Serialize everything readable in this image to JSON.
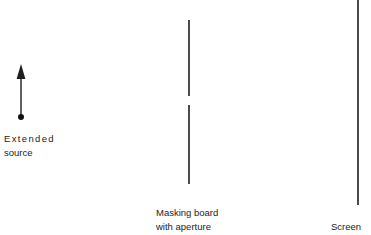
{
  "figure": {
    "background_color": "#ffffff",
    "stroke_color": "#2b2b2b",
    "text_color": "#1d1d1d",
    "width": 371,
    "height": 235
  },
  "labels": {
    "source": {
      "line1": "Extended",
      "line2": "source"
    },
    "mask": {
      "line1": "Masking board",
      "line2": "with aperture"
    },
    "screen": {
      "line1": "Screen"
    }
  },
  "elements": {
    "source_arrow": {
      "name": "extended-source-arrow",
      "x": 21,
      "tip_y": 65,
      "base_y": 117,
      "arrowhead_height": 14,
      "arrowhead_width": 9,
      "dot_radius": 3
    },
    "masking_board": {
      "name": "masking-board",
      "x": 189,
      "upper_segment": {
        "y_start": 20,
        "y_end": 96
      },
      "aperture_gap": {
        "y_start": 96,
        "y_end": 105
      },
      "lower_segment": {
        "y_start": 105,
        "y_end": 184
      },
      "stroke_width": 1.6
    },
    "screen": {
      "name": "screen-plane",
      "x": 358,
      "y_start": 0,
      "y_end": 205,
      "stroke_width": 1.6
    }
  }
}
